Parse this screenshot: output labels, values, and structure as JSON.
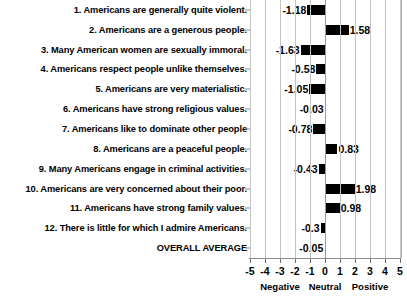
{
  "chart_data": {
    "type": "bar",
    "orientation": "horizontal",
    "title": "",
    "subtitle": "",
    "xlabel": "",
    "ylabel": "",
    "xlim": [
      -5,
      5
    ],
    "grid": true,
    "legend": "none",
    "zero_reference": 0,
    "categories": [
      "1. Americans are generally quite violent.",
      "2. Americans are a generous people.",
      "3. Many American women are sexually immoral.",
      "4. Americans respect people unlike themselves.",
      "5. Americans are very materialistic.",
      "6. Americans have strong religious values.",
      "7. Americans like to dominate other people",
      "8. Americans are a peaceful people.",
      "9. Many Americans engage in criminal activities.",
      "10. Americans are very concerned about their poor.",
      "11. Americans have strong family values.",
      "12. There is little for which I admire Americans.",
      "OVERALL AVERAGE"
    ],
    "values": [
      -1.18,
      1.58,
      -1.63,
      -0.58,
      -1.05,
      -0.03,
      -0.78,
      0.83,
      -0.43,
      1.98,
      0.98,
      -0.3,
      -0.05
    ],
    "value_labels": [
      "-1.18",
      "1.58",
      "-1.63",
      "-0.58",
      "-1.05",
      "-0.03",
      "-0.78",
      "0.83",
      "-0.43",
      "1.98",
      "0.98",
      "-0.3",
      "-0.05"
    ],
    "xticks": [
      -5,
      -4,
      -3,
      -2,
      -1,
      0,
      1,
      2,
      3,
      4,
      5
    ],
    "xtick_labels": [
      "-5",
      "-4",
      "-3",
      "-2",
      "-1",
      "0",
      "1",
      "2",
      "3",
      "4",
      "5"
    ],
    "zone_labels": [
      {
        "text": "Negative",
        "at": -3
      },
      {
        "text": "Neutral",
        "at": 0
      },
      {
        "text": "Positive",
        "at": 3
      }
    ],
    "bar_color": "#000000",
    "grid_color": "#c4c4c4",
    "axis_color": "#8c8c8c",
    "background": "#ffffff"
  }
}
